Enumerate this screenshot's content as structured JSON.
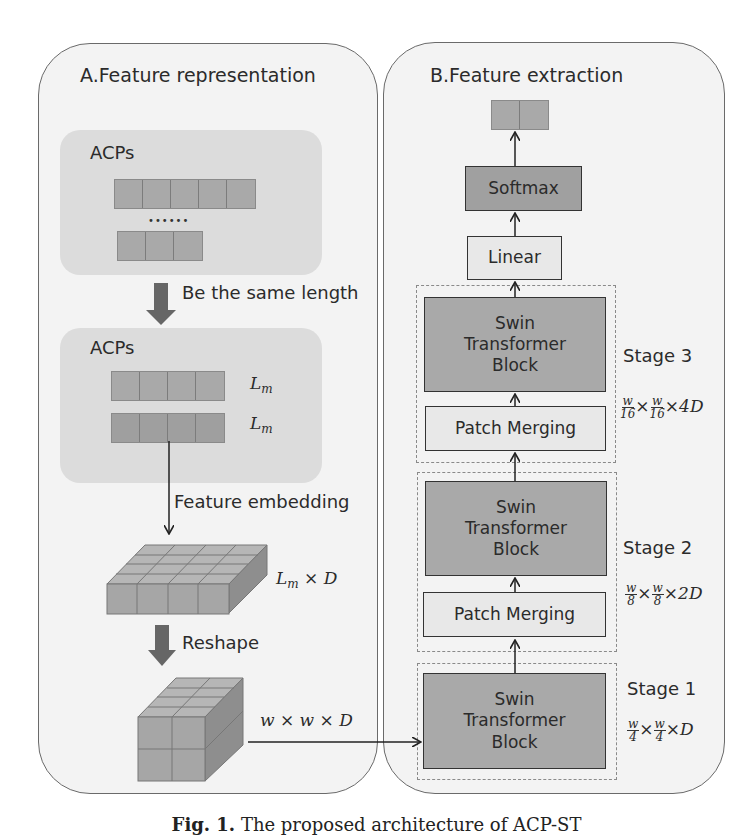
{
  "panel_a": {
    "title": "A.Feature representation",
    "group1": {
      "label": "ACPs",
      "rows": [
        5,
        3
      ],
      "ellipsis": "••••••"
    },
    "step1": "Be the same length",
    "group2": {
      "label": "ACPs",
      "rows": [
        4,
        4
      ],
      "row_labels": [
        "L",
        "L"
      ],
      "row_label_sub": "m"
    },
    "step2": "Feature embedding",
    "embed_dim": {
      "base": "L",
      "sub": "m",
      "rest": " × D"
    },
    "step3": "Reshape",
    "reshape_dim": "w × w × D"
  },
  "panel_b": {
    "title": "B.Feature extraction",
    "output_cells": 2,
    "softmax": "Softmax",
    "linear": "Linear",
    "stages": [
      {
        "name": "Stage 3",
        "block": [
          "Swin",
          "Transformer",
          "Block"
        ],
        "merge": "Patch Merging",
        "dim": {
          "num": "w",
          "den": "16",
          "mult": "4D"
        }
      },
      {
        "name": "Stage 2",
        "block": [
          "Swin",
          "Transformer",
          "Block"
        ],
        "merge": "Patch Merging",
        "dim": {
          "num": "w",
          "den": "8",
          "mult": "2D"
        }
      },
      {
        "name": "Stage 1",
        "block": [
          "Swin",
          "Transformer",
          "Block"
        ],
        "dim": {
          "num": "w",
          "den": "4",
          "mult": "D"
        }
      }
    ]
  },
  "caption": {
    "prefix": "Fig. 1.",
    "text": "The proposed architecture of ACP-ST"
  },
  "colors": {
    "panel_bg": "#f3f3f3",
    "group_bg": "#dcdcdc",
    "cell": "#a9a9a9",
    "block": "#a9a9a9",
    "softmax": "#a0a0a0",
    "linear": "#e8e8e8"
  }
}
